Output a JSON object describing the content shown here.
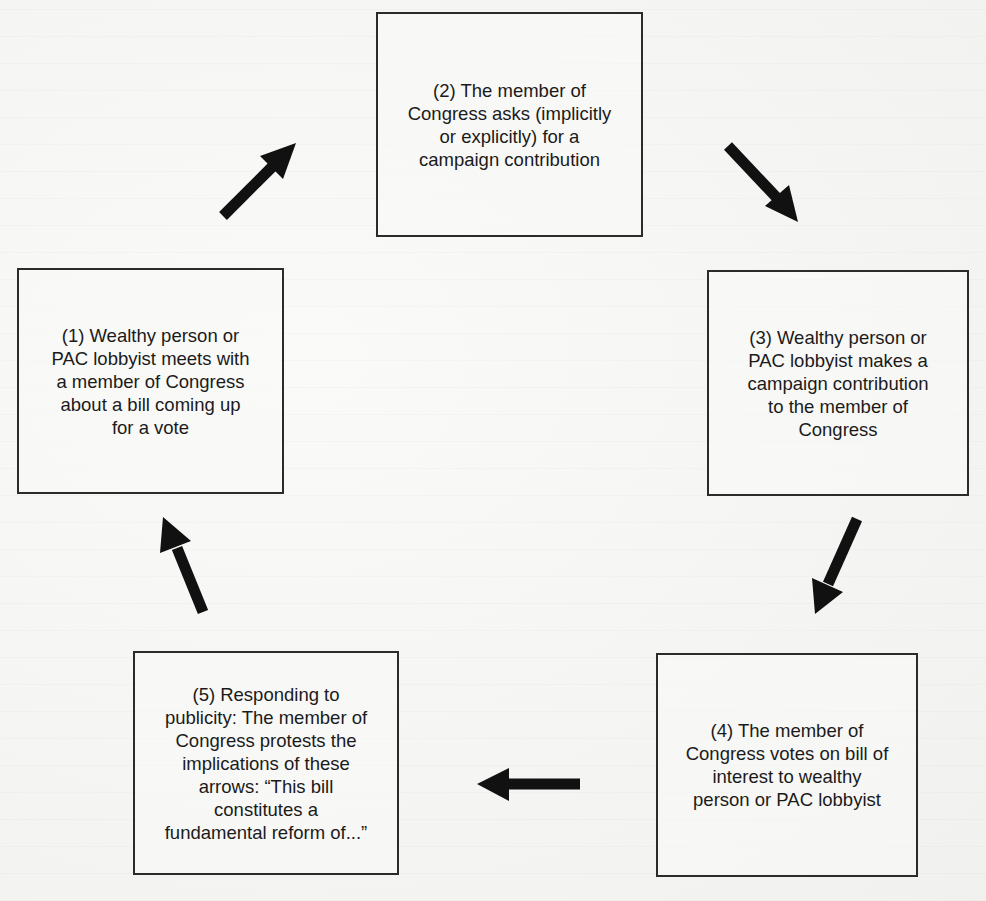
{
  "diagram": {
    "type": "cycle",
    "boxes": [
      {
        "id": 1,
        "text": "(1) Wealthy person or\nPAC lobbyist meets with\na member of Congress\nabout a bill coming up\nfor a vote"
      },
      {
        "id": 2,
        "text": "(2) The member of\nCongress asks (implicitly\nor explicitly) for a\ncampaign contribution"
      },
      {
        "id": 3,
        "text": "(3) Wealthy person or\nPAC lobbyist makes a\ncampaign contribution\nto the member of\nCongress"
      },
      {
        "id": 4,
        "text": "(4) The member of\nCongress votes on bill of\ninterest to wealthy\nperson or PAC lobbyist"
      },
      {
        "id": 5,
        "text": "(5) Responding to\npublicity: The member of\nCongress protests the\nimplications of these\narrows: “This bill\nconstitutes a\nfundamental reform of...”"
      }
    ],
    "arrows": [
      {
        "from": 1,
        "to": 2,
        "icon": "arrow-up-right-icon"
      },
      {
        "from": 2,
        "to": 3,
        "icon": "arrow-down-right-icon"
      },
      {
        "from": 3,
        "to": 4,
        "icon": "arrow-down-left-icon"
      },
      {
        "from": 4,
        "to": 5,
        "icon": "arrow-left-icon"
      },
      {
        "from": 5,
        "to": 1,
        "icon": "arrow-up-left-icon"
      }
    ],
    "colors": {
      "border": "#2b2b2b",
      "arrow": "#111111",
      "text": "#1b1b1b",
      "background": "#f3f3f1"
    }
  }
}
